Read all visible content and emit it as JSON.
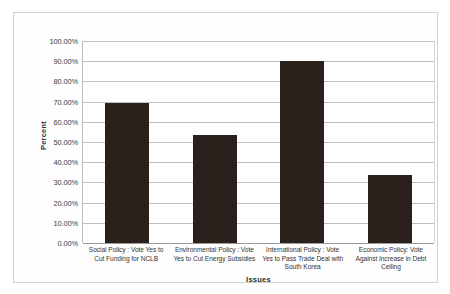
{
  "chart_data": {
    "type": "bar",
    "title": "",
    "xlabel": "Issues",
    "ylabel": "Percent",
    "ylim": [
      0,
      100
    ],
    "grid": true,
    "legend": "none",
    "categories": [
      "Social Policy : Vote Yes to Cut Funding for NCLB",
      "Environmental Policy : Vote Yes to Cut Energy Subsidies",
      "International Policy : Vote Yes to Pass Trade Deal with South Korea",
      "Economic Policy: Vote Against Increase in Debt Ceiling"
    ],
    "values": [
      69.5,
      53.5,
      90.0,
      33.5
    ],
    "ytick_labels": [
      "100.00%",
      "90.00%",
      "80.00%",
      "70.00%",
      "60.00%",
      "50.00%",
      "40.00%",
      "30.00%",
      "20.00%",
      "10.00%",
      "0.00%"
    ],
    "ytick_values": [
      100,
      90,
      80,
      70,
      60,
      50,
      40,
      30,
      20,
      10,
      0
    ],
    "bar_color": "#2a211c",
    "gridline_color": "#bfbfbf",
    "frame_color": "#d2d2d2"
  }
}
